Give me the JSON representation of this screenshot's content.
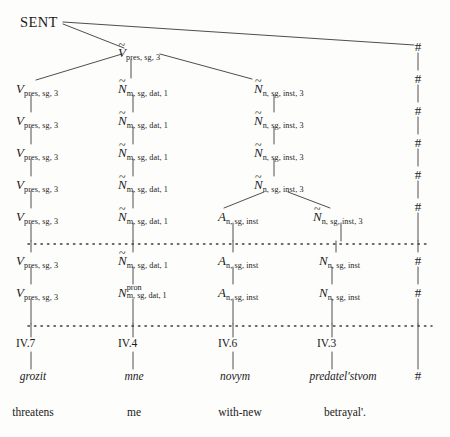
{
  "figure": {
    "root_label": "SENT",
    "boundary_symbol": "#",
    "columns_x": [
      31,
      133,
      233,
      332,
      418
    ],
    "tilde": "~"
  },
  "nodes": {
    "root": {
      "base": "SENT"
    },
    "v_tilde_top": {
      "base": "V",
      "tilde": true,
      "sub": "pres, sg, 3"
    },
    "v1": {
      "base": "V",
      "tilde": false,
      "sub": "pres, sg, 3"
    },
    "v2": {
      "base": "V",
      "tilde": false,
      "sub": "pres, sg, 3"
    },
    "v3": {
      "base": "V",
      "tilde": false,
      "sub": "pres, sg, 3"
    },
    "v4": {
      "base": "V",
      "tilde": false,
      "sub": "pres, sg, 3"
    },
    "v5": {
      "base": "V",
      "tilde": false,
      "sub": "pres, sg, 3"
    },
    "v6": {
      "base": "V",
      "tilde": false,
      "sub": "pres, sg, 3"
    },
    "v7": {
      "base": "V",
      "tilde": false,
      "sub": "pres, sg, 3"
    },
    "n1": {
      "base": "N",
      "tilde": true,
      "sub": "m, sg, dat, 1"
    },
    "n2": {
      "base": "N",
      "tilde": true,
      "sub": "m, sg, dat, 1"
    },
    "n3": {
      "base": "N",
      "tilde": true,
      "sub": "m, sg, dat, 1"
    },
    "n4": {
      "base": "N",
      "tilde": true,
      "sub": "m, sg, dat, 1"
    },
    "n5": {
      "base": "N",
      "tilde": true,
      "sub": "m, sg, dat, 1"
    },
    "n6": {
      "base": "N",
      "tilde": true,
      "sub": "m, sg, dat, 1"
    },
    "n7": {
      "base": "N",
      "tilde": false,
      "sup": "pron",
      "sub": "m, sg, dat, 1"
    },
    "r1": {
      "base": "N",
      "tilde": true,
      "sub": "n, sg, inst, 3"
    },
    "r2": {
      "base": "N",
      "tilde": true,
      "sub": "n, sg, inst, 3"
    },
    "r3": {
      "base": "N",
      "tilde": true,
      "sub": "n, sg, inst, 3"
    },
    "r4": {
      "base": "N",
      "tilde": true,
      "sub": "n, sg, inst, 3"
    },
    "r5": {
      "base": "N",
      "tilde": true,
      "sub": "n, sg, inst, 3"
    },
    "a1": {
      "base": "A",
      "tilde": false,
      "sub": "n, sg, inst"
    },
    "a2": {
      "base": "A",
      "tilde": false,
      "sub": "n, sg, inst"
    },
    "a3": {
      "base": "A",
      "tilde": false,
      "sub": "n, sg, inst"
    },
    "b1": {
      "base": "N",
      "tilde": false,
      "sub": "n, sg, inst"
    },
    "b2": {
      "base": "N",
      "tilde": false,
      "sub": "n, sg, inst"
    }
  },
  "hashes": [
    "#",
    "#",
    "#",
    "#",
    "#",
    "#",
    "#",
    "#",
    "#"
  ],
  "rules": [
    {
      "label": "IV.7"
    },
    {
      "label": "IV.4"
    },
    {
      "label": "IV.6"
    },
    {
      "label": "IV.3"
    }
  ],
  "words": [
    {
      "surface": "grozit",
      "gloss": "threatens"
    },
    {
      "surface": "mne",
      "gloss": "me"
    },
    {
      "surface": "novym",
      "gloss": "with-new"
    },
    {
      "surface": "predatel'stvom",
      "gloss": "betrayal'."
    }
  ],
  "colors": {
    "ink": "#1b1b1b",
    "paper": "#fdfdfb",
    "line": "#3a3a3a"
  }
}
